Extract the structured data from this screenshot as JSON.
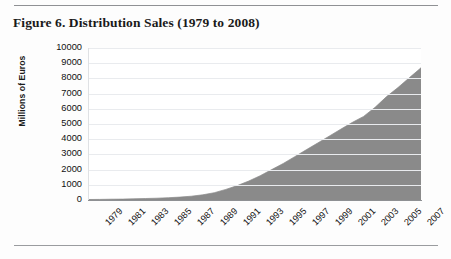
{
  "figure": {
    "title": "Figure 6. Distribution Sales (1979 to 2008)",
    "rule_color": "#8f9194"
  },
  "chart_data": {
    "type": "area",
    "title": "Figure 6. Distribution Sales (1979 to 2008)",
    "xlabel": "",
    "ylabel": "Millions of Euros",
    "ylim": [
      0,
      10000
    ],
    "ytick_labels": [
      "10000",
      "9000",
      "8000",
      "7000",
      "6000",
      "5000",
      "4000",
      "3000",
      "2000",
      "1000",
      "0"
    ],
    "ytick_values": [
      10000,
      9000,
      8000,
      7000,
      6000,
      5000,
      4000,
      3000,
      2000,
      1000,
      0
    ],
    "grid": true,
    "legend": "none",
    "series_color": "#8a8a8a",
    "x": [
      1979,
      1980,
      1981,
      1982,
      1983,
      1984,
      1985,
      1986,
      1987,
      1988,
      1989,
      1990,
      1991,
      1992,
      1993,
      1994,
      1995,
      1996,
      1997,
      1998,
      1999,
      2000,
      2001,
      2002,
      2003,
      2004,
      2005,
      2006,
      2007,
      2008
    ],
    "xtick_labels": [
      "1979",
      "1981",
      "1983",
      "1985",
      "1987",
      "1989",
      "1991",
      "1993",
      "1995",
      "1997",
      "1999",
      "2001",
      "2003",
      "2005",
      "2007"
    ],
    "series": [
      {
        "name": "Distribution Sales",
        "values": [
          30,
          40,
          50,
          60,
          80,
          100,
          120,
          150,
          190,
          250,
          340,
          480,
          700,
          950,
          1250,
          1600,
          2000,
          2400,
          2850,
          3300,
          3750,
          4200,
          4650,
          5100,
          5500,
          6100,
          6800,
          7400,
          8050,
          8700
        ]
      }
    ]
  }
}
